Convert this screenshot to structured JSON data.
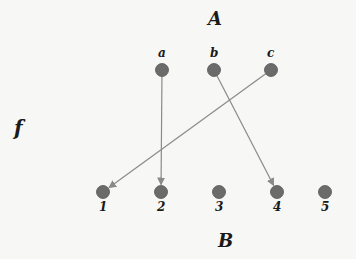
{
  "diagram": {
    "set_labels": {
      "top": "A",
      "bottom": "B",
      "function": "f"
    },
    "domain_nodes": [
      {
        "id": "a",
        "label": "a",
        "x": 162,
        "y": 70
      },
      {
        "id": "b",
        "label": "b",
        "x": 214,
        "y": 70
      },
      {
        "id": "c",
        "label": "c",
        "x": 271,
        "y": 70
      }
    ],
    "codomain_nodes": [
      {
        "id": "1",
        "label": "1",
        "x": 103,
        "y": 192
      },
      {
        "id": "2",
        "label": "2",
        "x": 161,
        "y": 192
      },
      {
        "id": "3",
        "label": "3",
        "x": 219,
        "y": 192
      },
      {
        "id": "4",
        "label": "4",
        "x": 277,
        "y": 192
      },
      {
        "id": "5",
        "label": "5",
        "x": 325,
        "y": 192
      }
    ],
    "edges": [
      {
        "from": "a",
        "to": "2"
      },
      {
        "from": "b",
        "to": "4"
      },
      {
        "from": "c",
        "to": "1"
      }
    ],
    "colors": {
      "node": "#6b6b6b",
      "node_stroke": "#555555",
      "edge": "#8a8a8a",
      "label": "#1a1a1a",
      "background": "#f7f7f5"
    }
  }
}
